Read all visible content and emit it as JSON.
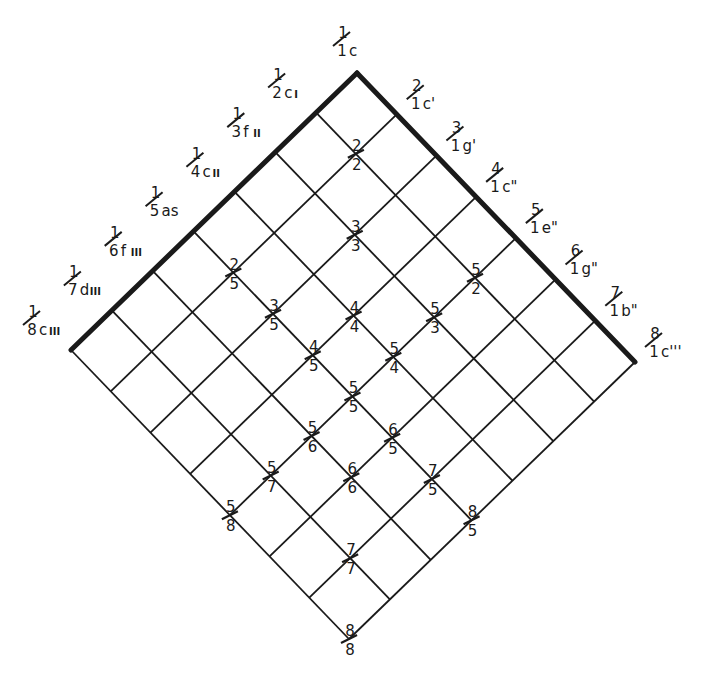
{
  "diagram": {
    "type": "ratio-lattice",
    "colors": {
      "line": "#1a1a1a",
      "background": "#ffffff"
    },
    "geometry": {
      "top": [
        357,
        73
      ],
      "left": [
        71,
        350
      ],
      "right": [
        635,
        362
      ],
      "bottom": [
        347,
        639
      ],
      "divisions": 7
    },
    "top_label": {
      "num": "1",
      "den": "1",
      "note": "c"
    },
    "left_edge_labels": [
      {
        "num": "1",
        "den": "2",
        "note": "c",
        "mark": "I"
      },
      {
        "num": "1",
        "den": "3",
        "note": "f",
        "mark": "II"
      },
      {
        "num": "1",
        "den": "4",
        "note": "c",
        "mark": "II"
      },
      {
        "num": "1",
        "den": "5",
        "note": "as",
        "mark": ""
      },
      {
        "num": "1",
        "den": "6",
        "note": "f",
        "mark": "III"
      },
      {
        "num": "1",
        "den": "7",
        "note": "d",
        "mark": "III"
      },
      {
        "num": "1",
        "den": "8",
        "note": "c",
        "mark": "III"
      }
    ],
    "right_edge_labels": [
      {
        "num": "2",
        "den": "1",
        "note": "c'",
        "mark": ""
      },
      {
        "num": "3",
        "den": "1",
        "note": "g'",
        "mark": ""
      },
      {
        "num": "4",
        "den": "1",
        "note": "c\"",
        "mark": ""
      },
      {
        "num": "5",
        "den": "1",
        "note": "e\"",
        "mark": ""
      },
      {
        "num": "6",
        "den": "1",
        "note": "g\"",
        "mark": ""
      },
      {
        "num": "7",
        "den": "1",
        "note": "b\"",
        "mark": ""
      },
      {
        "num": "8",
        "den": "1",
        "note": "c'''",
        "mark": ""
      }
    ],
    "interior_labels": [
      {
        "num": "2",
        "den": "2"
      },
      {
        "num": "3",
        "den": "3"
      },
      {
        "num": "4",
        "den": "4"
      },
      {
        "num": "5",
        "den": "5"
      },
      {
        "num": "6",
        "den": "6"
      },
      {
        "num": "7",
        "den": "7"
      },
      {
        "num": "8",
        "den": "8"
      },
      {
        "num": "2",
        "den": "5"
      },
      {
        "num": "3",
        "den": "5"
      },
      {
        "num": "4",
        "den": "5"
      },
      {
        "num": "5",
        "den": "6"
      },
      {
        "num": "5",
        "den": "7"
      },
      {
        "num": "5",
        "den": "8"
      },
      {
        "num": "5",
        "den": "2"
      },
      {
        "num": "5",
        "den": "3"
      },
      {
        "num": "5",
        "den": "4"
      },
      {
        "num": "6",
        "den": "5"
      },
      {
        "num": "7",
        "den": "5"
      },
      {
        "num": "8",
        "den": "5"
      }
    ]
  }
}
